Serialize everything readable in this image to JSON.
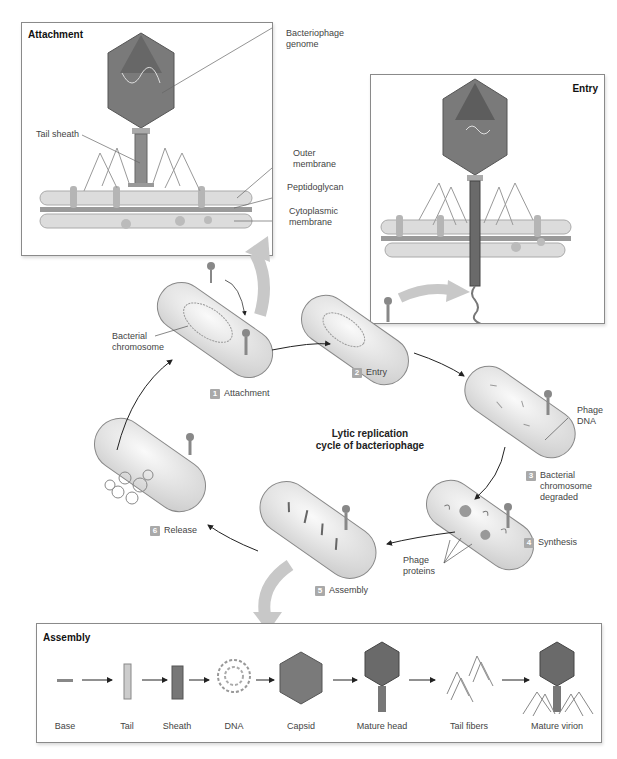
{
  "title": "Lytic replication\ncycle of bacteriophage",
  "colors": {
    "panel_border": "#8a8a8a",
    "badge": "#a9a9a9",
    "cell_fill": "#eeeeee",
    "capsid": "#7a7a7a",
    "membrane": "#d4d4d4",
    "big_arrow": "#c8c8c8",
    "text": "#444444"
  },
  "attachment_panel": {
    "title": "Attachment",
    "labels": {
      "genome": "Bacteriophage\ngenome",
      "tail_sheath": "Tail sheath",
      "outer_membrane": "Outer\nmembrane",
      "peptidoglycan": "Peptidoglycan",
      "cytoplasmic_membrane": "Cytoplasmic\nmembrane"
    }
  },
  "entry_panel": {
    "title": "Entry"
  },
  "cycle": {
    "steps": [
      {
        "num": "1",
        "label": "Attachment"
      },
      {
        "num": "2",
        "label": "Entry"
      },
      {
        "num": "3",
        "label": "Bacterial\nchromosome\ndegraded"
      },
      {
        "num": "4",
        "label": "Synthesis"
      },
      {
        "num": "5",
        "label": "Assembly"
      },
      {
        "num": "6",
        "label": "Release"
      }
    ],
    "annotations": {
      "bacterial_chromosome": "Bacterial\nchromosome",
      "phage_dna": "Phage\nDNA",
      "phage_proteins": "Phage\nproteins"
    }
  },
  "assembly_panel": {
    "title": "Assembly",
    "parts": [
      {
        "label": "Base"
      },
      {
        "label": "Tail"
      },
      {
        "label": "Sheath"
      },
      {
        "label": "DNA"
      },
      {
        "label": "Capsid"
      },
      {
        "label": "Mature head"
      },
      {
        "label": "Tail fibers"
      },
      {
        "label": "Mature virion"
      }
    ]
  }
}
